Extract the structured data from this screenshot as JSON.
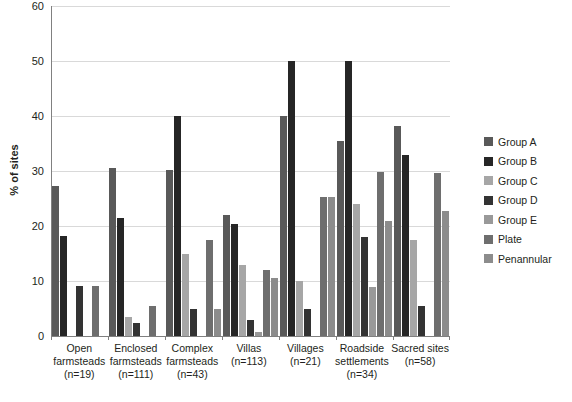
{
  "chart_data": {
    "type": "bar",
    "title": "",
    "subtitle": "",
    "xlabel": "",
    "ylabel": "% of sites",
    "ylim": [
      0,
      60
    ],
    "yticks": [
      0,
      10,
      20,
      30,
      40,
      50,
      60
    ],
    "ytick_labels": [
      "0",
      "10",
      "20",
      "30",
      "40",
      "50",
      "60"
    ],
    "grid": "horizontal",
    "legend_position": "right",
    "categories": [
      "Open farmsteads (n=19)",
      "Enclosed farmsteads (n=111)",
      "Complex farmsteads (n=43)",
      "Villas (n=113)",
      "Villages (n=21)",
      "Roadside settlements (n=34)",
      "Sacred sites (n=58)"
    ],
    "category_lines": [
      [
        "Open",
        "farmsteads",
        "(n=19)"
      ],
      [
        "Enclosed",
        "farmsteads",
        "(n=111)"
      ],
      [
        "Complex",
        "farmsteads",
        "(n=43)"
      ],
      [
        "Villas",
        "(n=113)"
      ],
      [
        "Villages",
        "(n=21)"
      ],
      [
        "Roadside",
        "settlements",
        "(n=34)"
      ],
      [
        "Sacred sites",
        "(n=58)"
      ]
    ],
    "series": [
      {
        "name": "Group A",
        "color": "#595959",
        "values": [
          27.3,
          30.5,
          30.2,
          22.0,
          40.0,
          35.5,
          38.2
        ]
      },
      {
        "name": "Group B",
        "color": "#262626",
        "values": [
          18.2,
          21.5,
          40.0,
          20.3,
          50.0,
          50.0,
          33.0
        ]
      },
      {
        "name": "Group C",
        "color": "#a6a6a6",
        "values": [
          0.0,
          3.5,
          15.0,
          13.0,
          10.0,
          24.0,
          17.5
        ]
      },
      {
        "name": "Group D",
        "color": "#333333",
        "values": [
          9.1,
          2.3,
          5.0,
          3.0,
          5.0,
          18.0,
          5.4
        ]
      },
      {
        "name": "Group E",
        "color": "#999999",
        "values": [
          0.0,
          0.0,
          0.0,
          0.8,
          0.0,
          9.0,
          0.0
        ]
      },
      {
        "name": "Plate",
        "color": "#6e6e6e",
        "values": [
          9.1,
          5.5,
          17.5,
          12.0,
          25.2,
          29.8,
          29.7
        ]
      },
      {
        "name": "Penannular",
        "color": "#8c8c8c",
        "values": [
          0.0,
          0.0,
          5.0,
          10.5,
          25.2,
          20.9,
          22.7
        ]
      }
    ]
  },
  "legend": {
    "items": [
      {
        "label": "Group A"
      },
      {
        "label": "Group B"
      },
      {
        "label": "Group C"
      },
      {
        "label": "Group D"
      },
      {
        "label": "Group E"
      },
      {
        "label": "Plate"
      },
      {
        "label": "Penannular"
      }
    ]
  }
}
